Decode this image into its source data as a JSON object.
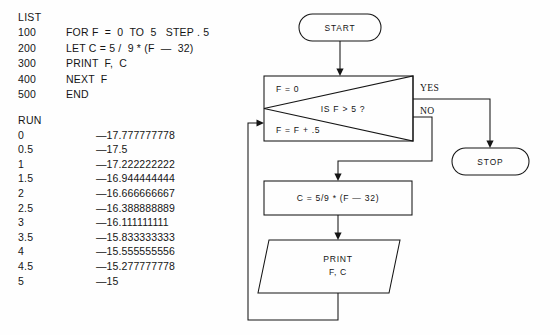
{
  "listing": {
    "header": "LIST",
    "lines": [
      {
        "number": "100",
        "statement": "FOR F  =  0  TO  5   STEP . 5"
      },
      {
        "number": "200",
        "statement": "LET C = 5 /  9 * (F  —  32)"
      },
      {
        "number": "300",
        "statement": "PRINT  F,  C"
      },
      {
        "number": "400",
        "statement": "NEXT  F"
      },
      {
        "number": "500",
        "statement": "END"
      }
    ]
  },
  "run": {
    "header": "RUN",
    "rows": [
      {
        "f": "0",
        "c": "—17.777777778"
      },
      {
        "f": "0.5",
        "c": "—17.5"
      },
      {
        "f": "1",
        "c": "—17.222222222"
      },
      {
        "f": "1.5",
        "c": "—16.944444444"
      },
      {
        "f": "2",
        "c": "—16.666666667"
      },
      {
        "f": "2.5",
        "c": "—16.388888889"
      },
      {
        "f": "3",
        "c": "—16.111111111"
      },
      {
        "f": "3.5",
        "c": "—15.833333333"
      },
      {
        "f": "4",
        "c": "—15.555555556"
      },
      {
        "f": "4.5",
        "c": "—15.277777778"
      },
      {
        "f": "5",
        "c": "—15"
      }
    ]
  },
  "flowchart": {
    "start_label": "START",
    "stop_label": "STOP",
    "decision": {
      "init_label": "F = 0",
      "increment_label": "F = F + .5",
      "test_label": "IS F  >  5 ?",
      "yes_label": "YES",
      "no_label": "NO"
    },
    "process_label": "C = 5/9  *  (F — 32)",
    "print_label_line1": "PRINT",
    "print_label_line2": "F, C",
    "stroke_color": "#151515",
    "background_color": "#fefefe"
  }
}
